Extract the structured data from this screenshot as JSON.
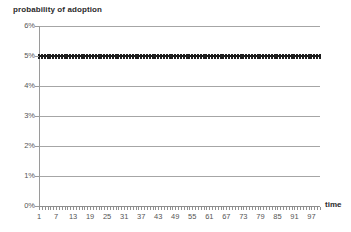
{
  "chart_data": {
    "type": "line",
    "title": "probability of adoption",
    "xlabel": "time",
    "ylabel": "probability of adoption",
    "grid": true,
    "legend": "none",
    "xlim": [
      1,
      100
    ],
    "ylim": [
      0,
      6
    ],
    "ytick_labels": [
      "6%",
      "5%",
      "4%",
      "3%",
      "2%",
      "1%",
      "0%"
    ],
    "ytick_values": [
      6,
      5,
      4,
      3,
      2,
      1,
      0
    ],
    "xtick_labels": [
      "1",
      "7",
      "13",
      "19",
      "25",
      "31",
      "37",
      "43",
      "49",
      "55",
      "61",
      "67",
      "73",
      "79",
      "85",
      "91",
      "97"
    ],
    "xtick_values": [
      1,
      7,
      13,
      19,
      25,
      31,
      37,
      43,
      49,
      55,
      61,
      67,
      73,
      79,
      85,
      91,
      97
    ],
    "series": [
      {
        "name": "probability of adoption",
        "color": "#1d1d1d",
        "marker": "square",
        "constant_value": 5,
        "n_points": 100,
        "x": [
          1,
          2,
          3,
          4,
          5,
          6,
          7,
          8,
          9,
          10,
          11,
          12,
          13,
          14,
          15,
          16,
          17,
          18,
          19,
          20,
          21,
          22,
          23,
          24,
          25,
          26,
          27,
          28,
          29,
          30,
          31,
          32,
          33,
          34,
          35,
          36,
          37,
          38,
          39,
          40,
          41,
          42,
          43,
          44,
          45,
          46,
          47,
          48,
          49,
          50,
          51,
          52,
          53,
          54,
          55,
          56,
          57,
          58,
          59,
          60,
          61,
          62,
          63,
          64,
          65,
          66,
          67,
          68,
          69,
          70,
          71,
          72,
          73,
          74,
          75,
          76,
          77,
          78,
          79,
          80,
          81,
          82,
          83,
          84,
          85,
          86,
          87,
          88,
          89,
          90,
          91,
          92,
          93,
          94,
          95,
          96,
          97,
          98,
          99,
          100
        ],
        "values": [
          5,
          5,
          5,
          5,
          5,
          5,
          5,
          5,
          5,
          5,
          5,
          5,
          5,
          5,
          5,
          5,
          5,
          5,
          5,
          5,
          5,
          5,
          5,
          5,
          5,
          5,
          5,
          5,
          5,
          5,
          5,
          5,
          5,
          5,
          5,
          5,
          5,
          5,
          5,
          5,
          5,
          5,
          5,
          5,
          5,
          5,
          5,
          5,
          5,
          5,
          5,
          5,
          5,
          5,
          5,
          5,
          5,
          5,
          5,
          5,
          5,
          5,
          5,
          5,
          5,
          5,
          5,
          5,
          5,
          5,
          5,
          5,
          5,
          5,
          5,
          5,
          5,
          5,
          5,
          5,
          5,
          5,
          5,
          5,
          5,
          5,
          5,
          5,
          5,
          5,
          5,
          5,
          5,
          5,
          5,
          5,
          5,
          5,
          5,
          5
        ]
      }
    ],
    "colors": {
      "gridline": "#a6a6a6",
      "axis": "#8f8f8f",
      "series": "#1d1d1d",
      "tick_label": "#555555",
      "caption": "#2b2b2b",
      "background": "#ffffff"
    }
  }
}
